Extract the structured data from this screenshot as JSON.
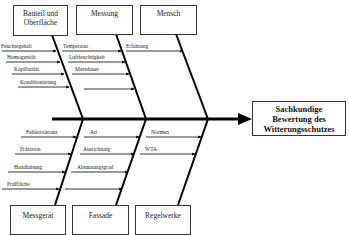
{
  "effect": {
    "line1": "Sachkundige",
    "line2": "Bewertung des",
    "line3": "Witterungsschutzes"
  },
  "categories_top": [
    {
      "title_line1": "Bauteil und",
      "title_line2": "Oberfläche",
      "causes": [
        "Feuchtegehalt",
        "Homogenität",
        "Kapillarität",
        "Konditionierung"
      ]
    },
    {
      "title_line1": "Messung",
      "title_line2": "",
      "causes": [
        "Temperatur",
        "Luftfeuchtigkeit",
        "Messdauer",
        ""
      ]
    },
    {
      "title_line1": "Mensch",
      "title_line2": "",
      "causes": [
        "Erfahrung"
      ]
    }
  ],
  "categories_bottom": [
    {
      "title": "Messgerät",
      "causes": [
        "Fehlertoleranz",
        "Präzision",
        "Handhabung",
        "Prüffläche"
      ]
    },
    {
      "title": "Fassade",
      "causes": [
        "Art",
        "Ausrichtung",
        "Abnutzungsgrad",
        ""
      ]
    },
    {
      "title": "Regelwerke",
      "causes": [
        "Normen",
        "WTA"
      ]
    }
  ],
  "colors": {
    "line": "#000000",
    "box_border": "#333333",
    "background": "#ffffff"
  }
}
